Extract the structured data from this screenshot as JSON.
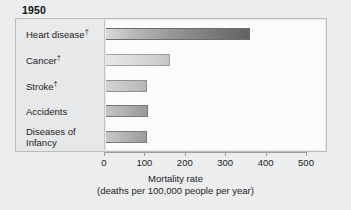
{
  "chart_data": {
    "type": "bar",
    "orientation": "horizontal",
    "title": "1950",
    "categories": [
      "Heart disease†",
      "Cancer†",
      "Stroke†",
      "Accidents",
      "Diseases of Infancy"
    ],
    "category_lines": [
      [
        "Heart disease†"
      ],
      [
        "Cancer†"
      ],
      [
        "Stroke†"
      ],
      [
        "Accidents"
      ],
      [
        "Diseases of",
        "Infancy"
      ]
    ],
    "values": [
      360,
      162,
      105,
      107,
      105
    ],
    "xlabel": "Mortality rate",
    "xlabel_sub": "(deaths per 100,000 people per year)",
    "ylabel": "",
    "xlim": [
      0,
      500
    ],
    "xticks": [
      0,
      100,
      200,
      300,
      400,
      500
    ],
    "xtick_labels": [
      "0",
      "100",
      "200",
      "300",
      "400",
      "500"
    ],
    "grid": true,
    "legend": "none",
    "bar_colors": [
      "#909293",
      "#dcdddd",
      "#c6c8c9",
      "#b2b4b5",
      "#b5b7b8"
    ],
    "frame_color": "#b9bcbd",
    "background": "#ecedee"
  }
}
